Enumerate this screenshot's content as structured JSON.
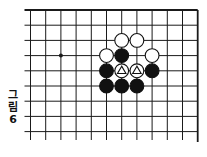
{
  "diagram": {
    "type": "go-board-partial",
    "caption": {
      "chars": [
        "그",
        "림",
        "6"
      ],
      "text": "그림 6"
    },
    "grid": {
      "origin_x": 30.5,
      "origin_y": 10,
      "spacing_x": 15.2,
      "spacing_y": 15.2,
      "columns": 12,
      "rows": 9,
      "edges": [
        "top",
        "right"
      ],
      "line_color": "#1a1a1a"
    },
    "star_points": [
      {
        "col": 2,
        "row": 3
      }
    ],
    "stones": [
      {
        "col": 6,
        "row": 2,
        "color": "white",
        "marker": ""
      },
      {
        "col": 7,
        "row": 2,
        "color": "white",
        "marker": ""
      },
      {
        "col": 5,
        "row": 3,
        "color": "white",
        "marker": ""
      },
      {
        "col": 6,
        "row": 3,
        "color": "black",
        "marker": ""
      },
      {
        "col": 8,
        "row": 3,
        "color": "white",
        "marker": ""
      },
      {
        "col": 5,
        "row": 4,
        "color": "black",
        "marker": ""
      },
      {
        "col": 6,
        "row": 4,
        "color": "white",
        "marker": "triangle"
      },
      {
        "col": 7,
        "row": 4,
        "color": "white",
        "marker": "triangle"
      },
      {
        "col": 8,
        "row": 4,
        "color": "black",
        "marker": ""
      },
      {
        "col": 5,
        "row": 5,
        "color": "black",
        "marker": ""
      },
      {
        "col": 6,
        "row": 5,
        "color": "black",
        "marker": ""
      },
      {
        "col": 7,
        "row": 5,
        "color": "black",
        "marker": ""
      }
    ],
    "colors": {
      "black_stone": "#111111",
      "white_stone": "#ffffff",
      "stone_outline": "#111111",
      "background": "#ffffff"
    }
  }
}
